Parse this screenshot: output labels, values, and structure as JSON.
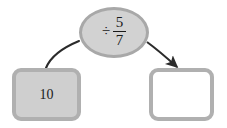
{
  "diagram": {
    "operator_node": {
      "symbol": "÷",
      "fraction": {
        "numerator": "5",
        "denominator": "7"
      },
      "expression": "÷ 5/7",
      "fill_color": "#d2d2d2",
      "border_color": "#a8a8a8"
    },
    "input_box": {
      "value": "10",
      "fill_color": "#cfcfcf",
      "border_color": "#b0b0b0"
    },
    "output_box": {
      "value": "",
      "fill_color": "#ffffff",
      "border_color": "#b0b0b0"
    },
    "connectors": [
      {
        "name": "input-to-operator",
        "from": "input_box",
        "to": "operator_node",
        "has_arrowhead": false,
        "color": "#2b2b2b"
      },
      {
        "name": "operator-to-output",
        "from": "operator_node",
        "to": "output_box",
        "has_arrowhead": true,
        "color": "#2b2b2b"
      }
    ],
    "background_color": "#ffffff"
  }
}
